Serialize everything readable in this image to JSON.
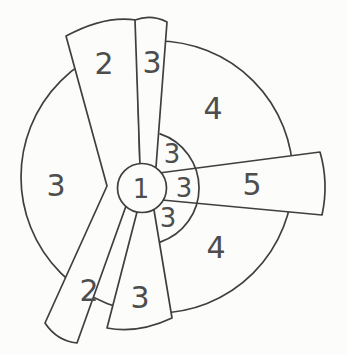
{
  "diagram": {
    "background_color": "#fcfcfa",
    "line_color": "#3f3f3f",
    "label_color": "#4d4d4d",
    "labels": [
      {
        "region": "hub-center",
        "text": "1"
      },
      {
        "region": "blade-upper-left",
        "text": "2"
      },
      {
        "region": "blade-top",
        "text": "3"
      },
      {
        "region": "sector-upper-right",
        "text": "4"
      },
      {
        "region": "sector-left",
        "text": "3"
      },
      {
        "region": "blade-right",
        "text": "5"
      },
      {
        "region": "sector-lower-right",
        "text": "4"
      },
      {
        "region": "blade-lower-left",
        "text": "2"
      },
      {
        "region": "blade-bottom",
        "text": "3"
      },
      {
        "region": "ring-upper",
        "text": "3"
      },
      {
        "region": "ring-middle",
        "text": "3"
      },
      {
        "region": "ring-lower",
        "text": "3"
      }
    ]
  }
}
